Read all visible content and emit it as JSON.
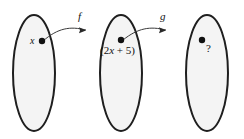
{
  "diagram": {
    "background_color": "#ffffff",
    "oval_fill": "#f4f4f4",
    "oval_stroke": "#1f1f1f",
    "dot_color": "#111111",
    "arrow_color": "#3a3a3a",
    "sets": [
      {
        "id": "domain-set",
        "element_label": "x",
        "cx": 34,
        "cy": 73,
        "rx": 21,
        "ry": 58,
        "dot_x": 42,
        "dot_y": 41
      },
      {
        "id": "intermediate-set",
        "element_label": "(2x + 5)",
        "cx": 121,
        "cy": 73,
        "rx": 21,
        "ry": 58,
        "dot_x": 121,
        "dot_y": 40
      },
      {
        "id": "codomain-set",
        "element_label": "?",
        "cx": 207,
        "cy": 73,
        "rx": 21,
        "ry": 58,
        "dot_x": 202,
        "dot_y": 40
      }
    ],
    "arrows": [
      {
        "id": "arrow-f",
        "label": "f",
        "label_x": 78,
        "label_y": 12,
        "path": "M 43 41 C 58 28, 70 26, 86 30",
        "head_x": 84,
        "head_y": 30
      },
      {
        "id": "arrow-g",
        "label": "g",
        "label_x": 160,
        "label_y": 12,
        "path": "M 123 40 C 138 28, 150 26, 166 30",
        "head_x": 164,
        "head_y": 30
      }
    ],
    "labels": {
      "x_label": "x",
      "expr_prefix": "(2",
      "expr_var": "x",
      "expr_suffix": " + 5)",
      "question_label": "?",
      "f_label": "f",
      "g_label": "g"
    }
  }
}
